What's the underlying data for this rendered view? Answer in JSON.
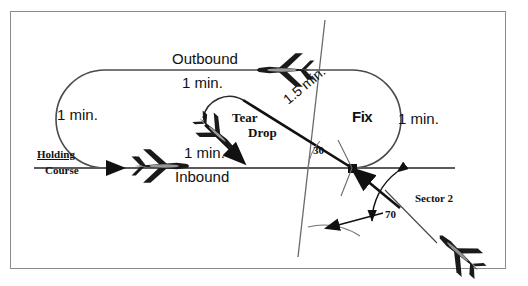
{
  "diagram": {
    "frame_color": "#8a8a8a",
    "line_color": "#555555",
    "ink_color": "#111111"
  },
  "labels": {
    "outbound": "Outbound",
    "outbound_time": "1 min.",
    "left_turn_time": "1 min.",
    "right_turn_time": "1 min.",
    "fix": "Fix",
    "tear": "Tear",
    "drop": "Drop",
    "inbound": "Inbound",
    "inbound_time": "1 min.",
    "holding": "Holding",
    "course": "Course",
    "sector2": "Sector 2",
    "angle_30": "30",
    "angle_70": "70",
    "teardrop_time": "1.5 min."
  },
  "aircraft": [
    {
      "name": "outbound-aircraft",
      "heading": "west"
    },
    {
      "name": "inbound-aircraft",
      "heading": "east"
    },
    {
      "name": "teardrop-aircraft",
      "heading": "southeast"
    },
    {
      "name": "entry-aircraft",
      "heading": "northwest"
    }
  ]
}
